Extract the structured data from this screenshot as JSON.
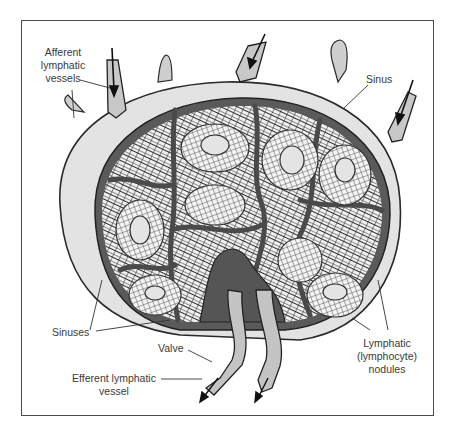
{
  "diagram": {
    "labels": {
      "afferent": "Afferent\nlymphatic\nvessels",
      "sinus": "Sinus",
      "sinuses": "Sinuses",
      "valve": "Valve",
      "efferent": "Efferent lymphatic\nvessel",
      "nodules": "Lymphatic\n(lymphocyte)\nnodules"
    },
    "colors": {
      "capsule": "#e2e2e2",
      "outline": "#2a2a2a",
      "sinus_dark": "#5e5e5e",
      "tissue": "#3c3c3c",
      "nodule_center": "#d8d8d8",
      "vessel": "#b8b8b8",
      "frame": "#4a4a4a"
    }
  }
}
